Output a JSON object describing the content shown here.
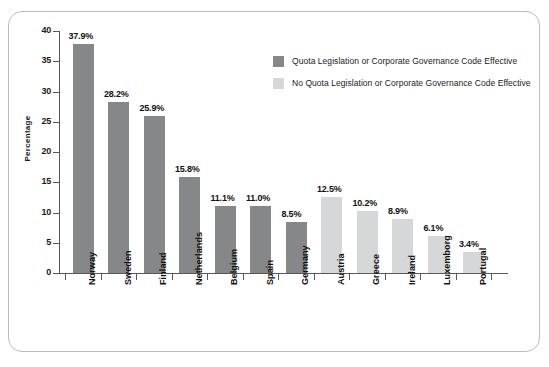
{
  "chart_data": {
    "type": "bar",
    "title": "",
    "xlabel": "",
    "ylabel": "Percentage",
    "ylim": [
      0,
      40
    ],
    "ytick_step": 5,
    "yticks": [
      "40",
      "35",
      "30",
      "25",
      "20",
      "15",
      "10",
      "5",
      "0"
    ],
    "grid": false,
    "legend_position": "upper-right-inside",
    "categories": [
      "Norway",
      "Sweden",
      "Finland",
      "Netherlands",
      "Belgium",
      "Spain",
      "Germany",
      "Austria",
      "Greece",
      "Ireland",
      "Luxemborg",
      "Portugal"
    ],
    "values": [
      37.9,
      28.2,
      25.9,
      15.8,
      11.1,
      11.0,
      8.5,
      12.5,
      10.2,
      8.9,
      6.1,
      3.4
    ],
    "value_labels": [
      "37.9%",
      "28.2%",
      "25.9%",
      "15.8%",
      "11.1%",
      "11.0%",
      "8.5%",
      "12.5%",
      "10.2%",
      "8.9%",
      "6.1%",
      "3.4%"
    ],
    "groups": [
      "quota",
      "quota",
      "quota",
      "quota",
      "quota",
      "quota",
      "quota",
      "no-quota",
      "no-quota",
      "no-quota",
      "no-quota",
      "no-quota"
    ],
    "colors": {
      "quota": "#868789",
      "no_quota": "#d6d7d9",
      "axis": "#58585a",
      "text": "#111111",
      "frame": "#b9bcc0",
      "background": "#ffffff"
    },
    "legend": [
      {
        "key": "quota",
        "label": "Quota Legislation or Corporate Governance Code Effective",
        "color": "#868789"
      },
      {
        "key": "no-quota",
        "label": "No Quota Legislation or Corporate Governance Code Effective",
        "color": "#d6d7d9"
      }
    ]
  }
}
